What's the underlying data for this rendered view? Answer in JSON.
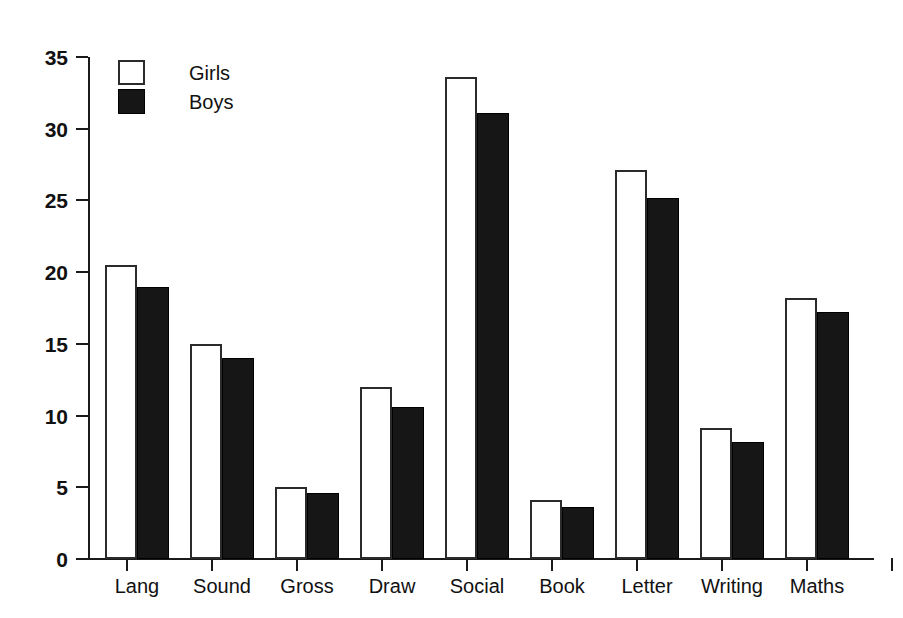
{
  "chart_data": {
    "type": "bar",
    "title": "",
    "subtitle": "",
    "xlabel": "",
    "ylabel": "",
    "ylim": [
      0,
      35
    ],
    "yticks": [
      0,
      5,
      10,
      15,
      20,
      25,
      30,
      35
    ],
    "ytick_labels": [
      "0",
      "5",
      "10",
      "15",
      "20",
      "25",
      "30",
      "35"
    ],
    "grid": false,
    "legend_position": "top-left",
    "categories": [
      "Lang",
      "Sound",
      "Gross",
      "Draw",
      "Social",
      "Book",
      "Letter",
      "Writing",
      "Maths"
    ],
    "series": [
      {
        "name": "Girls",
        "color": "#ffffff",
        "edge_color": "#2b2b2b",
        "values": [
          20.5,
          15.0,
          5.0,
          12.0,
          33.6,
          4.1,
          27.1,
          9.1,
          18.2
        ]
      },
      {
        "name": "Boys",
        "color": "#161616",
        "edge_color": "#000000",
        "values": [
          19.0,
          14.0,
          4.6,
          10.6,
          31.1,
          3.65,
          25.2,
          8.15,
          17.2
        ]
      }
    ]
  },
  "legend": {
    "items": [
      {
        "label": "Girls",
        "swatch": "girls"
      },
      {
        "label": "Boys",
        "swatch": "boys"
      }
    ]
  }
}
